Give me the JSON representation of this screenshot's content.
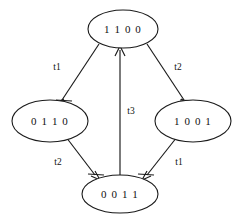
{
  "diagram": {
    "type": "state-transition-graph",
    "background_color": "#ffffff",
    "stroke_color": "#1a1a1a",
    "text_color": "#111111",
    "nodes": [
      {
        "id": "top",
        "label": "1 1 0 0",
        "cx": 123,
        "cy": 29,
        "rx": 35,
        "ry": 19
      },
      {
        "id": "left",
        "label": "0 1 1 0",
        "cx": 50,
        "cy": 121,
        "rx": 38,
        "ry": 21
      },
      {
        "id": "right",
        "label": "1 0 0 1",
        "cx": 193,
        "cy": 121,
        "rx": 38,
        "ry": 21
      },
      {
        "id": "bottom",
        "label": "0 0 1 1",
        "cx": 120,
        "cy": 194,
        "rx": 38,
        "ry": 19
      }
    ],
    "edges": [
      {
        "id": "top-to-left",
        "from": "1 1 0 0",
        "to": "0 1 1 0",
        "label": "t1",
        "label_x": 57,
        "label_y": 68
      },
      {
        "id": "top-to-right",
        "from": "1 1 0 0",
        "to": "1 0 0 1",
        "label": "t2",
        "label_x": 178,
        "label_y": 68
      },
      {
        "id": "left-to-bottom",
        "from": "0 1 1 0",
        "to": "0 0 1 1",
        "label": "t2",
        "label_x": 58,
        "label_y": 163
      },
      {
        "id": "right-to-bottom",
        "from": "1 0 0 1",
        "to": "0 0 1 1",
        "label": "t1",
        "label_x": 179,
        "label_y": 163
      },
      {
        "id": "bottom-to-top",
        "from": "0 0 1 1",
        "to": "1 1 0 0",
        "label": "t3",
        "label_x": 131,
        "label_y": 112
      }
    ]
  }
}
